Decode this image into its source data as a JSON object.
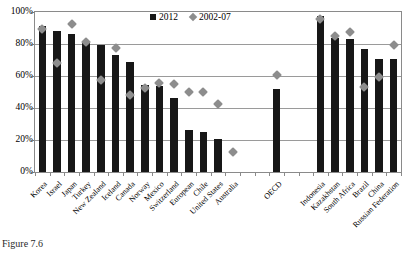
{
  "caption": "Figure 7.6",
  "legend": {
    "items": [
      {
        "label": "2012",
        "marker": "square",
        "color": "#171717"
      },
      {
        "label": "2002-07",
        "marker": "diamond",
        "color": "#8d8d8d"
      }
    ]
  },
  "chart_data": {
    "type": "bar",
    "title": "",
    "xlabel": "",
    "ylabel": "",
    "ylim": [
      0,
      100
    ],
    "yticks": [
      "0%",
      "20%",
      "40%",
      "60%",
      "80%",
      "100%"
    ],
    "ytick_values": [
      0,
      20,
      40,
      60,
      80,
      100
    ],
    "grid": true,
    "legend_position": "top-center",
    "unit": "percent",
    "categories": [
      "Korea",
      "Israel",
      "Japan",
      "Turkey",
      "New Zealand",
      "Iceland",
      "Canada",
      "Norway",
      "Mexico",
      "Switzerland",
      "European",
      "Chile",
      "United States",
      "Australia",
      "OECD",
      "Indonesia",
      "Kazakhstan",
      "South Africa",
      "Brazil",
      "China",
      "Russian Federation"
    ],
    "group_gaps_after": [
      "Australia",
      "OECD"
    ],
    "series": [
      {
        "name": "2012",
        "type": "bar",
        "color": "#171717",
        "values": [
          91.5,
          88,
          86,
          81.5,
          79.5,
          73,
          68.5,
          54.5,
          53.5,
          46,
          26,
          25,
          20.5,
          null,
          52,
          97.5,
          84,
          83,
          77,
          70.5,
          70.5
        ]
      },
      {
        "name": "2002-07",
        "type": "scatter",
        "color": "#8d8d8d",
        "values": [
          91.5,
          70.5,
          94.5,
          83.5,
          59.5,
          79.5,
          50.5,
          55,
          58,
          57.5,
          52,
          52,
          44.5,
          15,
          63,
          98,
          87.5,
          89.5,
          55.5,
          61.5,
          81.5
        ]
      }
    ]
  }
}
